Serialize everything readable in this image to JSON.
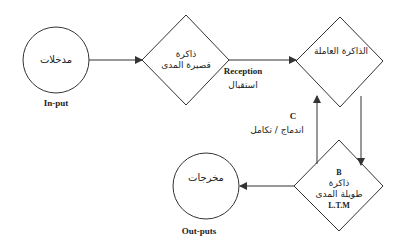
{
  "diagram": {
    "nodes": [
      {
        "id": "input",
        "shape": "circle",
        "label_ar": "مدخلات",
        "caption": "In-put"
      },
      {
        "id": "short_term_memory",
        "shape": "diamond",
        "label_ar_line1": "ذاكرة",
        "label_ar_line2": "قصيرة المدى"
      },
      {
        "id": "working_memory",
        "shape": "diamond",
        "label_ar": "الذاكرة العاملة"
      },
      {
        "id": "long_term_memory",
        "shape": "diamond",
        "label_letter": "B",
        "label_ar_line1": "ذاكرة",
        "label_ar_line2": "طويلة المدى",
        "label_en": "L.T.M"
      },
      {
        "id": "output",
        "shape": "circle",
        "label_ar": "مخرجات",
        "caption": "Out-puts"
      }
    ],
    "edges": [
      {
        "from": "input",
        "to": "short_term_memory"
      },
      {
        "from": "short_term_memory",
        "to": "working_memory",
        "label_en": "Reception",
        "label_ar": "استقبال"
      },
      {
        "from": "working_memory",
        "to": "long_term_memory"
      },
      {
        "from": "long_term_memory",
        "to": "working_memory",
        "label_letter": "C",
        "label_ar": "اندماج / تكامل"
      },
      {
        "from": "long_term_memory",
        "to": "output"
      }
    ],
    "colors": {
      "stroke": "#333333",
      "background": "#ffffff",
      "text": "#222222"
    }
  }
}
